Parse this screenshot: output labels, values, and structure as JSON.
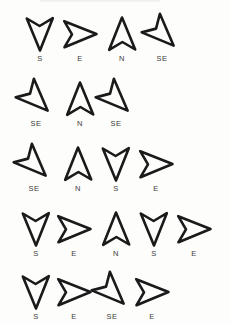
{
  "page": {
    "background_color": "#fdfdfc",
    "stroke_color": "#1a1a1a",
    "label_color": "#3b3b3b",
    "partial_top_line": ""
  },
  "legend": {
    "directions": {
      "S": "south",
      "E": "east",
      "N": "north",
      "SE": "southeast"
    }
  },
  "rows": [
    {
      "row_label": "row-1",
      "y": 14,
      "cells": [
        {
          "label": "S",
          "direction": "south",
          "rotation": 180,
          "x": 18
        },
        {
          "label": "E",
          "direction": "east",
          "rotation": 90,
          "x": 58
        },
        {
          "label": "N",
          "direction": "north",
          "rotation": 0,
          "x": 100
        },
        {
          "label": "SE",
          "direction": "southeast",
          "rotation": 135,
          "x": 140
        }
      ]
    },
    {
      "row_label": "row-2",
      "y": 79,
      "cells": [
        {
          "label": "SE",
          "direction": "southeast",
          "rotation": 135,
          "x": 14
        },
        {
          "label": "N",
          "direction": "north",
          "rotation": 0,
          "x": 58
        },
        {
          "label": "SE",
          "direction": "southeast",
          "rotation": 135,
          "x": 94
        }
      ]
    },
    {
      "row_label": "row-3",
      "y": 144,
      "cells": [
        {
          "label": "SE",
          "direction": "southeast",
          "rotation": 135,
          "x": 12
        },
        {
          "label": "N",
          "direction": "north",
          "rotation": 0,
          "x": 56
        },
        {
          "label": "S",
          "direction": "south",
          "rotation": 180,
          "x": 94
        },
        {
          "label": "E",
          "direction": "east",
          "rotation": 90,
          "x": 134
        }
      ]
    },
    {
      "row_label": "row-4",
      "y": 209,
      "cells": [
        {
          "label": "S",
          "direction": "south",
          "rotation": 180,
          "x": 14
        },
        {
          "label": "E",
          "direction": "east",
          "rotation": 90,
          "x": 52
        },
        {
          "label": "N",
          "direction": "north",
          "rotation": 0,
          "x": 94
        },
        {
          "label": "S",
          "direction": "south",
          "rotation": 180,
          "x": 132
        },
        {
          "label": "E",
          "direction": "east",
          "rotation": 90,
          "x": 172
        }
      ]
    },
    {
      "row_label": "row-5",
      "y": 272,
      "cells": [
        {
          "label": "S",
          "direction": "south",
          "rotation": 180,
          "x": 14
        },
        {
          "label": "E",
          "direction": "east",
          "rotation": 90,
          "x": 52
        },
        {
          "label": "SE",
          "direction": "southeast",
          "rotation": 135,
          "x": 90
        },
        {
          "label": "E",
          "direction": "east",
          "rotation": 90,
          "x": 130
        }
      ]
    }
  ]
}
